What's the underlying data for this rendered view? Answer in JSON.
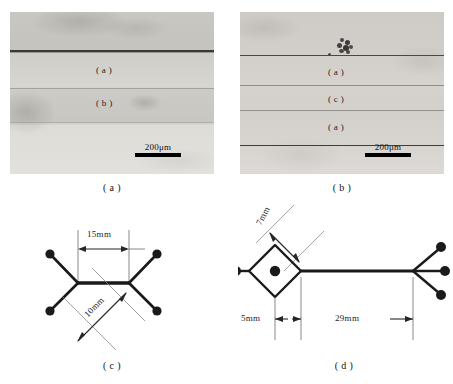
{
  "figure": {
    "kind": "composite-scientific-figure",
    "panels": [
      "a",
      "b",
      "c",
      "d"
    ]
  },
  "panel_a": {
    "caption": "( a )",
    "type": "optical-micrograph",
    "layer_labels": [
      "( a )",
      "( b )"
    ],
    "scalebar": {
      "text": "200μm",
      "length_px": 46
    }
  },
  "panel_b": {
    "caption": "( b )",
    "type": "optical-micrograph",
    "layer_labels": [
      "( a )",
      "( c )",
      "( a )"
    ],
    "scalebar": {
      "text": "200μm",
      "length_px": 46
    }
  },
  "panel_c": {
    "caption": "( c )",
    "type": "specimen-schematic",
    "dimensions": [
      {
        "name": "horizontal-span",
        "label": "15mm"
      },
      {
        "name": "diagonal-arm",
        "label": "10mm"
      }
    ],
    "node_count": 4
  },
  "panel_d": {
    "caption": "( d )",
    "type": "specimen-schematic",
    "dimensions": [
      {
        "name": "diamond-arm",
        "label": "7mm"
      },
      {
        "name": "diamond-width",
        "label": "5mm"
      },
      {
        "name": "stem-length",
        "label": "29mm"
      }
    ],
    "node_count": 5
  },
  "colors": {
    "ink": "#111111",
    "line": "#1a1a1a",
    "dim_line": "#555555",
    "micro_base": "#d6d4cf",
    "micro_dark_line": "#3a3936"
  }
}
